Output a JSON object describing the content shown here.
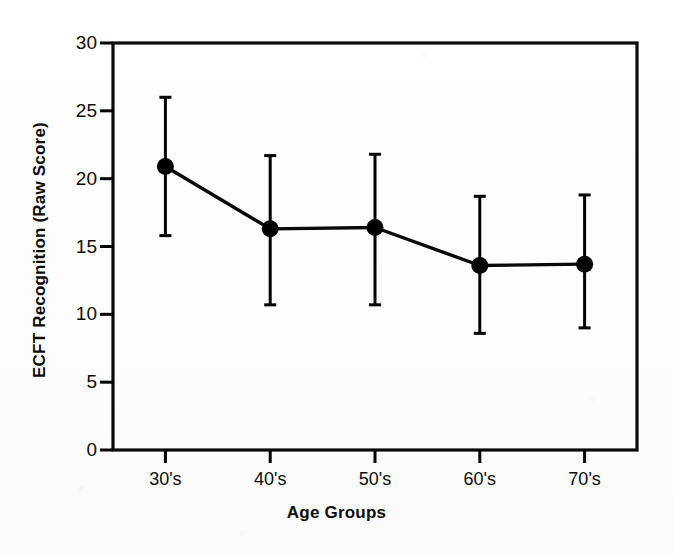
{
  "figure": {
    "background_color": "#ffffff",
    "ink_color": "#000000"
  },
  "chart_data": {
    "type": "line",
    "title": "",
    "subtitle": "",
    "xlabel": "Age Groups",
    "ylabel": "ECFT Recognition (Raw Score)",
    "categories": [
      "30's",
      "40's",
      "50's",
      "60's",
      "70's"
    ],
    "values": [
      20.9,
      16.3,
      16.4,
      13.6,
      13.7
    ],
    "error_upper": [
      26.0,
      21.7,
      21.8,
      18.7,
      18.8
    ],
    "error_lower": [
      15.8,
      10.7,
      10.7,
      8.6,
      9.0
    ],
    "series": [
      {
        "name": "ECFT Recognition",
        "values": [
          20.9,
          16.3,
          16.4,
          13.6,
          13.7
        ],
        "error_upper": [
          26.0,
          21.7,
          21.8,
          18.7,
          18.8
        ],
        "error_lower": [
          15.8,
          10.7,
          10.7,
          8.6,
          9.0
        ],
        "marker": "filled-circle",
        "color": "#000000"
      }
    ],
    "ylim": [
      0,
      30
    ],
    "yticks": [
      0,
      5,
      10,
      15,
      20,
      25,
      30
    ],
    "ytick_labels": [
      "0",
      "5",
      "10",
      "15",
      "20",
      "25",
      "30"
    ],
    "xtick_labels": [
      "30's",
      "40's",
      "50's",
      "60's",
      "70's"
    ],
    "grid": false,
    "legend": false,
    "legend_position": "none",
    "frame": "box",
    "tick_direction": "out",
    "error_bar_style": "capped"
  }
}
